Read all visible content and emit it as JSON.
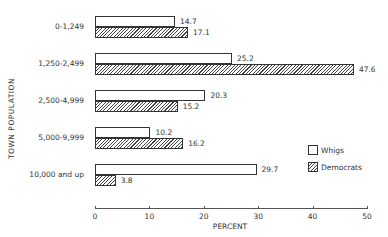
{
  "chart_data": {
    "type": "bar",
    "orientation": "horizontal",
    "title": "",
    "xlabel": "PERCENT",
    "ylabel": "TOWN POPULATION",
    "xlim": [
      0,
      50
    ],
    "xticks": [
      0,
      10,
      20,
      30,
      40,
      50
    ],
    "categories": [
      "0-1,249",
      "1,250-2,499",
      "2,500-4,999",
      "5,000-9,999",
      "10,000 and up"
    ],
    "series": [
      {
        "name": "Whigs",
        "pattern": "blank",
        "values": [
          14.7,
          25.2,
          20.3,
          10.2,
          29.7
        ],
        "labels": [
          "14.7",
          "25.2",
          "20.3",
          "10.2",
          "29.7"
        ]
      },
      {
        "name": "Democrats",
        "pattern": "hatched",
        "values": [
          17.1,
          47.6,
          15.2,
          16.2,
          3.8
        ],
        "labels": [
          "17.1",
          "47.6",
          "15.2",
          "16.2",
          "3.8"
        ]
      }
    ],
    "legend": {
      "position": "right",
      "entries": [
        "Whigs",
        "Democrats"
      ]
    },
    "grid": false
  }
}
